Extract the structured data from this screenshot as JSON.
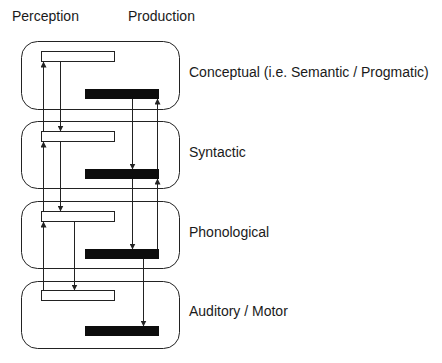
{
  "headers": {
    "perception": "Perception",
    "production": "Production"
  },
  "levels": [
    {
      "label": "Conceptual (i.e. Semantic / Progmatic)"
    },
    {
      "label": "Syntactic"
    },
    {
      "label": "Phonological"
    },
    {
      "label": "Auditory / Motor"
    }
  ],
  "colors": {
    "stroke": "#222222",
    "production_bar": "#0d0d0d",
    "perception_bar": "#ffffff"
  }
}
